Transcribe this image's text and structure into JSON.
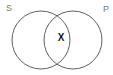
{
  "diagram": {
    "type": "venn",
    "sets": [
      {
        "label": "S",
        "position": "top-left"
      },
      {
        "label": "P",
        "position": "top-right"
      }
    ],
    "intersection": {
      "label": "X"
    },
    "colors": {
      "background": "#ffffff",
      "circle_stroke": "#606060",
      "set_label": "#7a7a7a",
      "intersection_label": "#1a1a1a"
    }
  }
}
